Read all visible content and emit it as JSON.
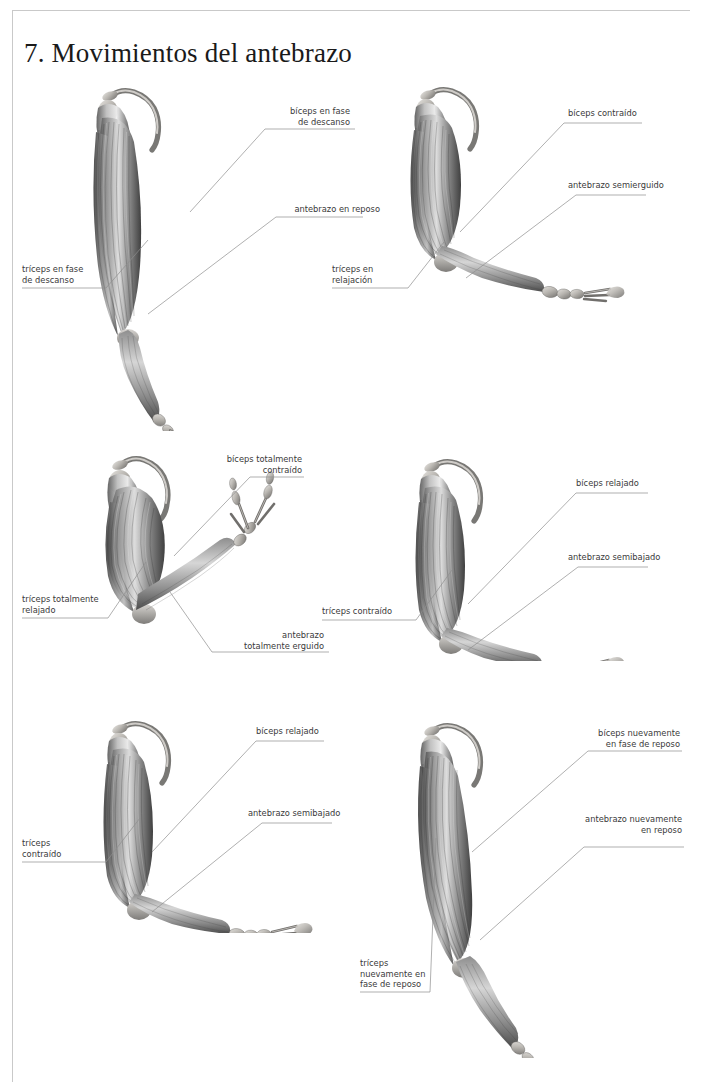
{
  "page": {
    "title": "7. Movimientos del antebrazo",
    "background": "#ffffff",
    "rule_color": "#c9c9c9",
    "text_color": "#3a3a3a",
    "leader_color": "#8e8e8e"
  },
  "figures": [
    {
      "id": "fig-1",
      "name": "brazo-en-reposo",
      "position": "top-left",
      "labels": {
        "biceps": "bíceps en fase\nde descanso",
        "antebrazo": "antebrazo en reposo",
        "triceps": "tríceps en fase\nde descanso"
      }
    },
    {
      "id": "fig-2",
      "name": "brazo-semierguido",
      "position": "top-right",
      "labels": {
        "biceps": "bíceps contraído",
        "antebrazo": "antebrazo semierguido",
        "triceps": "tríceps en\nrelajación"
      }
    },
    {
      "id": "fig-3",
      "name": "brazo-totalmente-erguido",
      "position": "middle-left",
      "labels": {
        "biceps": "bíceps totalmente\ncontraído",
        "antebrazo": "antebrazo\ntotalmente erguido",
        "triceps": "tríceps totalmente\nrelajado"
      }
    },
    {
      "id": "fig-4",
      "name": "brazo-semibajado",
      "position": "middle-right",
      "labels": {
        "biceps": "bíceps relajado",
        "antebrazo": "antebrazo semibajado",
        "triceps": "tríceps contraído"
      }
    },
    {
      "id": "fig-5",
      "name": "brazo-semibajado-descendiendo",
      "position": "bottom-left",
      "labels": {
        "biceps": "bíceps relajado",
        "antebrazo": "antebrazo semibajado",
        "triceps": "tríceps\ncontraído"
      }
    },
    {
      "id": "fig-6",
      "name": "brazo-nuevamente-en-reposo",
      "position": "bottom-right",
      "labels": {
        "biceps": "bíceps nuevamente\nen fase de reposo",
        "antebrazo": "antebrazo nuevamente\nen reposo",
        "triceps": "tríceps\nnuevamente en\nfase de reposo"
      }
    }
  ]
}
